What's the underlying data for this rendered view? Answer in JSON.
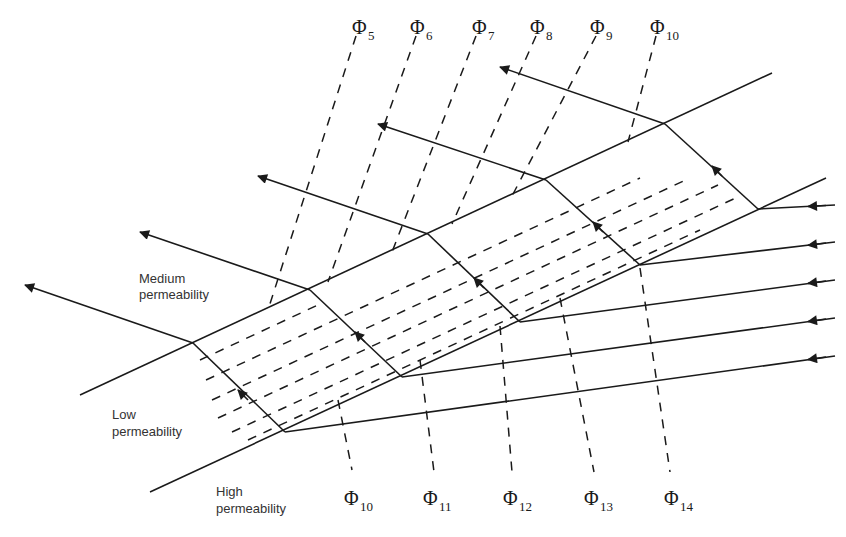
{
  "diagram": {
    "type": "refraction of flow lines across permeability layers",
    "zones": [
      {
        "id": "medium",
        "line1": "Medium",
        "line2": "permeability"
      },
      {
        "id": "low",
        "line1": "Low",
        "line2": "permeability"
      },
      {
        "id": "high",
        "line1": "High",
        "line2": "permeability"
      }
    ],
    "potential_labels_top": [
      {
        "symbol": "Φ",
        "sub": "5"
      },
      {
        "symbol": "Φ",
        "sub": "6"
      },
      {
        "symbol": "Φ",
        "sub": "7"
      },
      {
        "symbol": "Φ",
        "sub": "8"
      },
      {
        "symbol": "Φ",
        "sub": "9"
      },
      {
        "symbol": "Φ",
        "sub": "10"
      }
    ],
    "potential_labels_bottom": [
      {
        "symbol": "Φ",
        "sub": "10"
      },
      {
        "symbol": "Φ",
        "sub": "11"
      },
      {
        "symbol": "Φ",
        "sub": "12"
      },
      {
        "symbol": "Φ",
        "sub": "13"
      },
      {
        "symbol": "Φ",
        "sub": "14"
      }
    ],
    "flow_lines_count": 5,
    "line_color": "#1a1a1a"
  }
}
